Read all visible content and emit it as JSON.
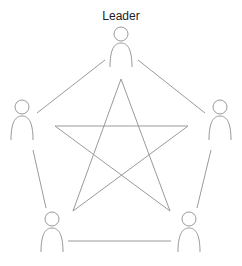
{
  "diagram": {
    "leader_label": "Leader",
    "line_color": "#9a9a9a",
    "nodes": [
      {
        "id": "leader",
        "x": 121,
        "y": 28
      },
      {
        "id": "left",
        "x": 22,
        "y": 108
      },
      {
        "id": "right",
        "x": 220,
        "y": 108
      },
      {
        "id": "bottom-left",
        "x": 52,
        "y": 218
      },
      {
        "id": "bottom-right",
        "x": 189,
        "y": 218
      }
    ]
  }
}
